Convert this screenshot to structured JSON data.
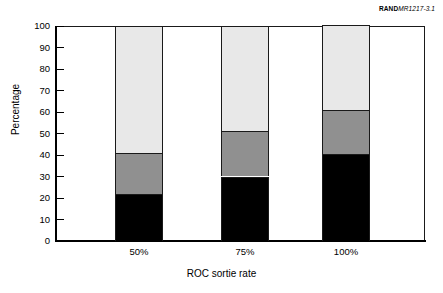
{
  "figure": {
    "source_tag_brand": "RAND",
    "source_tag_number": "MR1217-3.1"
  },
  "chart_data": {
    "type": "bar",
    "subtype": "stacked-vertical-100-percent",
    "title": "",
    "xlabel": "ROC sortie rate",
    "ylabel": "Percentage",
    "categories": [
      "50%",
      "75%",
      "100%"
    ],
    "ylim": [
      0,
      100
    ],
    "yticks": [
      0,
      10,
      20,
      30,
      40,
      50,
      60,
      70,
      80,
      90,
      100
    ],
    "ytick_labels": [
      "0",
      "10",
      "20",
      "30",
      "40",
      "50",
      "60",
      "70",
      "80",
      "90",
      "100"
    ],
    "grid": false,
    "legend": "none",
    "series": [
      {
        "name": "bottom-segment",
        "color": "#000000",
        "values": [
          22,
          30,
          40.5
        ]
      },
      {
        "name": "middle-segment",
        "color": "#909090",
        "values": [
          19,
          21,
          20.5
        ]
      },
      {
        "name": "top-segment",
        "color": "#e8e8e8",
        "values": [
          59,
          49,
          39.5
        ]
      }
    ],
    "cumulative_tops": {
      "bottom": [
        22,
        30,
        40.5
      ],
      "middle": [
        41,
        51,
        61
      ],
      "top": [
        100,
        100,
        100
      ]
    }
  },
  "colors": {
    "segment_bottom": "#000000",
    "segment_middle": "#909090",
    "segment_top": "#e8e8e8",
    "axis": "#000000",
    "frame": "#1a1a1a",
    "background": "#ffffff"
  }
}
